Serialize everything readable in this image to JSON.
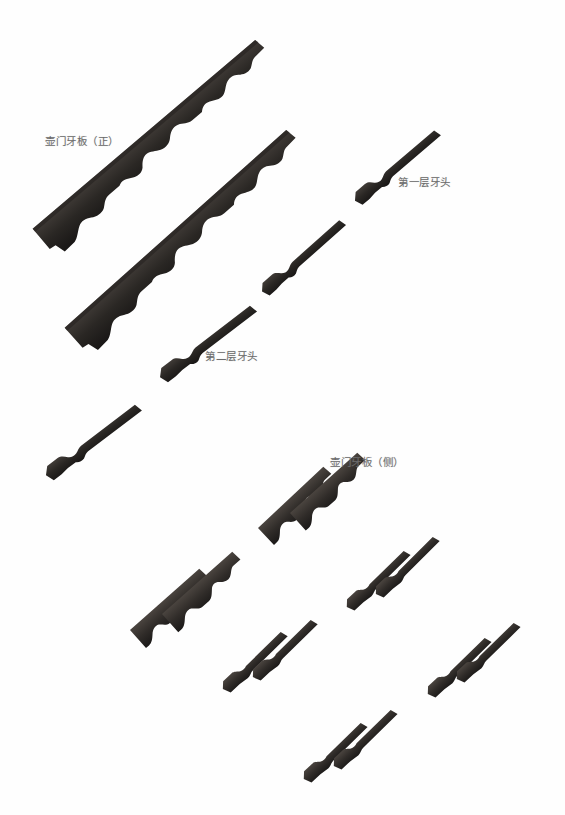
{
  "plate": {
    "title_visible": false,
    "background_color": "#ffffff",
    "object_color": "#2b2826",
    "label_color": "#6b6b6b",
    "width": 565,
    "height": 815
  },
  "labels": [
    {
      "id": "apron-front",
      "text": "壶门牙板（正）",
      "x": 45,
      "y": 133
    },
    {
      "id": "first-layer-tooth",
      "text": "第一层牙头",
      "x": 398,
      "y": 174
    },
    {
      "id": "second-layer-tooth",
      "text": "第二层牙头",
      "x": 205,
      "y": 348
    },
    {
      "id": "apron-side",
      "text": "壶门牙板（侧）",
      "x": 330,
      "y": 454
    }
  ],
  "pieces": [
    {
      "id": "long-apron-front-1",
      "kind": "long-scalloped-apron",
      "x1": 32,
      "y1": 228,
      "x2": 256,
      "y2": 38,
      "thickness": 11,
      "label_ref": "apron-front"
    },
    {
      "id": "long-apron-front-2",
      "kind": "long-scalloped-apron",
      "x1": 64,
      "y1": 327,
      "x2": 287,
      "y2": 128,
      "thickness": 11,
      "label_ref": "apron-front"
    },
    {
      "id": "tooth-head-1a",
      "kind": "tooth-head",
      "x1": 351,
      "y1": 196,
      "x2": 433,
      "y2": 126,
      "thickness": 8,
      "label_ref": "first-layer-tooth"
    },
    {
      "id": "tooth-head-1b",
      "kind": "tooth-head",
      "x1": 258,
      "y1": 287,
      "x2": 338,
      "y2": 216,
      "thickness": 8,
      "label_ref": "first-layer-tooth"
    },
    {
      "id": "tooth-head-2a",
      "kind": "tooth-head-long",
      "x1": 156,
      "y1": 372,
      "x2": 249,
      "y2": 301,
      "thickness": 8,
      "label_ref": "second-layer-tooth"
    },
    {
      "id": "tooth-head-2b",
      "kind": "tooth-head-long",
      "x1": 42,
      "y1": 470,
      "x2": 134,
      "y2": 400,
      "thickness": 8,
      "label_ref": "second-layer-tooth"
    },
    {
      "id": "side-apron-1",
      "kind": "side-scalloped-apron",
      "x1": 258,
      "y1": 528,
      "x2": 324,
      "y2": 466,
      "thickness": 10,
      "label_ref": "apron-side"
    },
    {
      "id": "side-apron-2",
      "kind": "side-scalloped-apron",
      "x1": 290,
      "y1": 513,
      "x2": 358,
      "y2": 452,
      "thickness": 10,
      "label_ref": "apron-side"
    },
    {
      "id": "side-apron-3",
      "kind": "side-scalloped-apron",
      "x1": 130,
      "y1": 630,
      "x2": 200,
      "y2": 568,
      "thickness": 10,
      "label_ref": "apron-side"
    },
    {
      "id": "side-apron-4",
      "kind": "side-scalloped-apron",
      "x1": 162,
      "y1": 614,
      "x2": 233,
      "y2": 551,
      "thickness": 10,
      "label_ref": "apron-side"
    },
    {
      "id": "small-tooth-1",
      "kind": "small-tooth-head",
      "x1": 343,
      "y1": 603,
      "x2": 403,
      "y2": 547,
      "thickness": 7
    },
    {
      "id": "small-tooth-2",
      "kind": "small-tooth-head",
      "x1": 372,
      "y1": 590,
      "x2": 432,
      "y2": 533,
      "thickness": 7
    },
    {
      "id": "small-tooth-3",
      "kind": "small-tooth-head",
      "x1": 219,
      "y1": 685,
      "x2": 280,
      "y2": 628
    },
    {
      "id": "small-tooth-4",
      "kind": "small-tooth-head",
      "x1": 249,
      "y1": 673,
      "x2": 310,
      "y2": 616
    },
    {
      "id": "small-tooth-5",
      "kind": "small-tooth-head",
      "x1": 424,
      "y1": 690,
      "x2": 484,
      "y2": 634
    },
    {
      "id": "small-tooth-6",
      "kind": "small-tooth-head",
      "x1": 453,
      "y1": 675,
      "x2": 513,
      "y2": 619
    },
    {
      "id": "small-tooth-7",
      "kind": "small-tooth-head",
      "x1": 300,
      "y1": 775,
      "x2": 360,
      "y2": 719
    },
    {
      "id": "small-tooth-8",
      "kind": "small-tooth-head",
      "x1": 330,
      "y1": 762,
      "x2": 390,
      "y2": 706
    }
  ]
}
